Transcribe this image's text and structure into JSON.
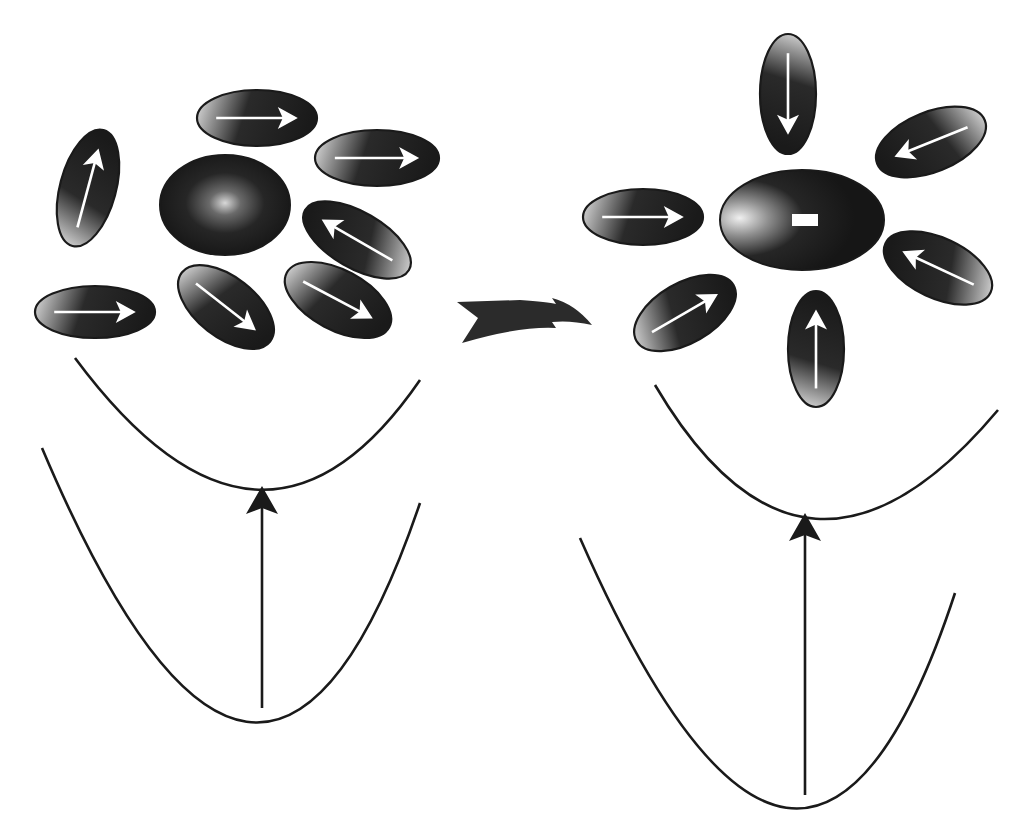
{
  "figure": {
    "colors": {
      "ink": "#1a1a1a",
      "background": "#ffffff",
      "highlight": "#f2f2f2"
    }
  },
  "panels": [
    {
      "id": "before",
      "label": "Ground-state solvation (random dipole orientation)",
      "solute": {
        "cx": 225,
        "cy": 205,
        "rx": 65,
        "ry": 50,
        "charge_mark": "",
        "highlight": "center"
      },
      "solvent_molecules": [
        {
          "cx": 257,
          "cy": 118,
          "rx": 60,
          "ry": 28,
          "rotate": 0,
          "arrow": "right"
        },
        {
          "cx": 377,
          "cy": 158,
          "rx": 62,
          "ry": 28,
          "rotate": 0,
          "arrow": "right"
        },
        {
          "cx": 88,
          "cy": 188,
          "rx": 60,
          "ry": 28,
          "rotate": -75,
          "arrow": "right"
        },
        {
          "cx": 357,
          "cy": 240,
          "rx": 60,
          "ry": 28,
          "rotate": 30,
          "arrow": "left"
        },
        {
          "cx": 95,
          "cy": 312,
          "rx": 60,
          "ry": 26,
          "rotate": 0,
          "arrow": "right"
        },
        {
          "cx": 226,
          "cy": 307,
          "rx": 56,
          "ry": 30,
          "rotate": 38,
          "arrow": "right"
        },
        {
          "cx": 338,
          "cy": 300,
          "rx": 58,
          "ry": 30,
          "rotate": 28,
          "arrow": "right"
        }
      ],
      "upper_curve": "M75,358 Q262,610 420,380",
      "lower_curve": "M42,448 Q262,968 420,503",
      "transition_arrow": {
        "x": 262,
        "y1": 708,
        "y2": 486
      }
    },
    {
      "id": "after",
      "label": "Relaxed solvation (dipoles oriented toward charged solute)",
      "solute": {
        "cx": 802,
        "cy": 220,
        "rx": 82,
        "ry": 50,
        "charge_mark": "−",
        "highlight": "left"
      },
      "solvent_molecules": [
        {
          "cx": 788,
          "cy": 94,
          "rx": 60,
          "ry": 28,
          "rotate": 90,
          "arrow": "right"
        },
        {
          "cx": 931,
          "cy": 142,
          "rx": 58,
          "ry": 30,
          "rotate": -22,
          "arrow": "left"
        },
        {
          "cx": 643,
          "cy": 217,
          "rx": 60,
          "ry": 28,
          "rotate": 0,
          "arrow": "right"
        },
        {
          "cx": 938,
          "cy": 268,
          "rx": 58,
          "ry": 30,
          "rotate": 25,
          "arrow": "left"
        },
        {
          "cx": 685,
          "cy": 313,
          "rx": 56,
          "ry": 30,
          "rotate": -30,
          "arrow": "right"
        },
        {
          "cx": 816,
          "cy": 349,
          "rx": 58,
          "ry": 28,
          "rotate": -90,
          "arrow": "right"
        }
      ],
      "upper_curve": "M655,385 Q805,640 998,410",
      "lower_curve": "M580,538 Q805,1050 955,593",
      "transition_arrow": {
        "x": 805,
        "y1": 795,
        "y2": 513
      }
    }
  ],
  "process_arrow": {
    "direction": "right",
    "meaning": "solvent relaxation"
  }
}
